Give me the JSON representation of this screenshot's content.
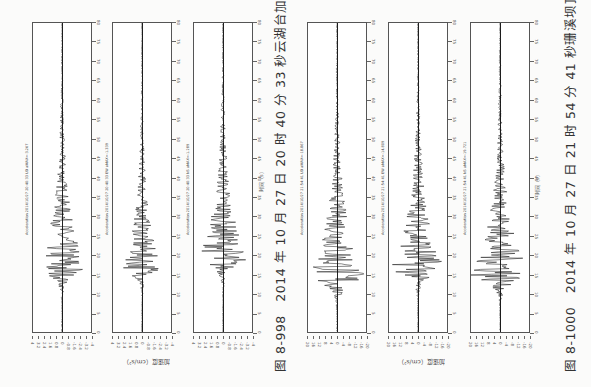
{
  "figures": [
    {
      "id": "fig-8-998",
      "caption": "图 8-998　2014 年 10 月 27 日 20 时 40 分 33 秒云湖台加速度记录",
      "ylabel": "加速度（cm/s²）",
      "xlabel": "时间（s）",
      "channels": [
        {
          "label": "Acceleration 2014/10/27 20:40:33 UD aMAX=-3.267",
          "peak_pos": 0.8,
          "amp": 0.45
        },
        {
          "label": "Acceleration 2014/10/27 20:40:33 EW aMAX=-1.339",
          "peak_pos": 0.8,
          "amp": 0.35
        },
        {
          "label": "Acceleration 2014/10/27 20:40:33 NS aMAX=-1.289",
          "peak_pos": 0.77,
          "amp": 0.45
        }
      ]
    },
    {
      "id": "fig-8-1000",
      "caption": "图 8-1000　2014 年 10 月 27 日 21 时 54 分 41 秒珊溪坝顶台加速度记录",
      "ylabel": "加速度（cm/s²）",
      "xlabel": "时间（s）",
      "channels": [
        {
          "label": "Acceleration 2014/10/27 21:54:41 UD aMAX=-18.867",
          "peak_pos": 0.83,
          "amp": 0.55
        },
        {
          "label": "Acceleration 2014/10/27 21:54:41 EW aMAX=-14.809",
          "peak_pos": 0.8,
          "amp": 0.5
        },
        {
          "label": "Acceleration 2014/10/27 21:54:41 NS aMAX=-19.721",
          "peak_pos": 0.82,
          "amp": 0.55
        }
      ]
    }
  ],
  "chart_data": [
    {
      "type": "line",
      "title": "图 8-998 2014 年 10 月 27 日 20 时 40 分 33 秒云湖台加速度记录",
      "xlabel": "时间（s）",
      "ylabel": "加速度（cm/s²）",
      "xlim": [
        0,
        80
      ],
      "x_ticks": [
        0,
        5,
        10,
        15,
        20,
        25,
        30,
        35,
        40,
        45,
        50,
        55,
        60,
        65,
        70,
        75,
        80
      ],
      "series": [
        {
          "name": "UD",
          "peak": -3.267
        },
        {
          "name": "EW",
          "peak": -1.339
        },
        {
          "name": "NS",
          "peak": -1.289
        }
      ]
    },
    {
      "type": "line",
      "title": "图 8-1000 2014 年 10 月 27 日 21 时 54 分 41 秒珊溪坝顶台加速度记录",
      "xlabel": "时间（s）",
      "ylabel": "加速度（cm/s²）",
      "xlim": [
        0,
        80
      ],
      "x_ticks": [
        0,
        5,
        10,
        15,
        20,
        25,
        30,
        35,
        40,
        45,
        50,
        55,
        60,
        65,
        70,
        75,
        80
      ],
      "series": [
        {
          "name": "UD",
          "peak": -18.867
        },
        {
          "name": "EW",
          "peak": -14.809
        },
        {
          "name": "NS",
          "peak": -19.721
        }
      ]
    }
  ],
  "time_ticks": [
    "80",
    "75",
    "70",
    "65",
    "60",
    "55",
    "50",
    "45",
    "40",
    "35",
    "30",
    "25",
    "20",
    "15",
    "10",
    "5",
    "0"
  ],
  "amp_ticks_a": [
    "4",
    "3.2",
    "2.4",
    "1.6",
    "0.8",
    "0",
    "-0.8",
    "-1.6",
    "-2.4",
    "-3.2",
    "-4"
  ],
  "amp_ticks_b": [
    "20",
    "16",
    "12",
    "8",
    "4",
    "0",
    "-4",
    "-8",
    "-12",
    "-16",
    "-20"
  ]
}
